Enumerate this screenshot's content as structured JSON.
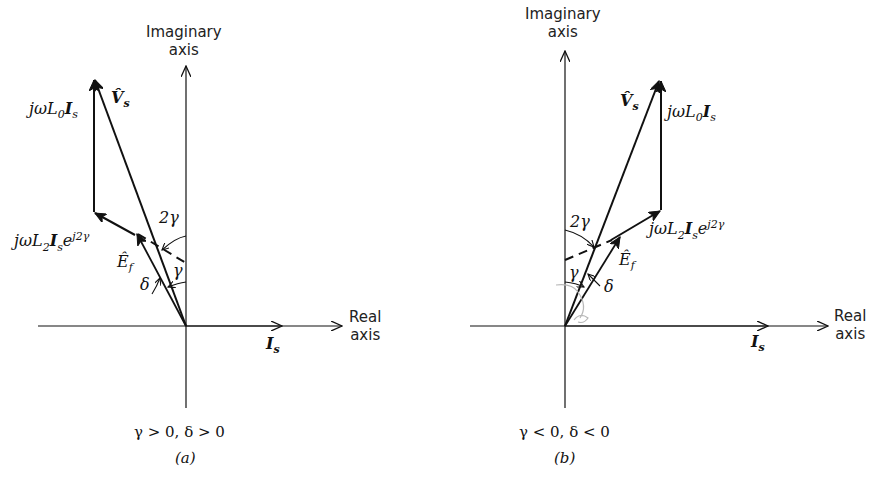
{
  "figure": {
    "panels": [
      {
        "id": "a",
        "imag_axis_label_line1": "Imaginary",
        "imag_axis_label_line2": "axis",
        "real_axis_label_line1": "Real",
        "real_axis_label_line2": "axis",
        "current_label": "I",
        "current_sub": "s",
        "vs_label": "V̂",
        "vs_sub": "s",
        "l0_pre": "jωL",
        "l0_sub1": "0",
        "l0_mid": "I",
        "l0_sub2": "s",
        "l2_pre": "jωL",
        "l2_sub1": "2",
        "l2_mid": "I",
        "l2_sub2": "s",
        "l2_e": "e",
        "l2_sup": "j2γ",
        "ef_label": "Ê",
        "ef_sub": "f",
        "angle_2gamma": "2γ",
        "angle_gamma": "γ",
        "angle_delta": "δ",
        "condition": "γ > 0, δ > 0",
        "caption": "(a)"
      },
      {
        "id": "b",
        "imag_axis_label_line1": "Imaginary",
        "imag_axis_label_line2": "axis",
        "real_axis_label_line1": "Real",
        "real_axis_label_line2": "axis",
        "current_label": "I",
        "current_sub": "s",
        "vs_label": "V̂",
        "vs_sub": "s",
        "l0_pre": "jωL",
        "l0_sub1": "0",
        "l0_mid": "I",
        "l0_sub2": "s",
        "l2_pre": "jωL",
        "l2_sub1": "2",
        "l2_mid": "I",
        "l2_sub2": "s",
        "l2_e": "e",
        "l2_sup": "j2γ",
        "ef_label": "Ê",
        "ef_sub": "f",
        "angle_2gamma": "2γ",
        "angle_gamma": "γ",
        "angle_delta": "δ",
        "condition": "γ < 0, δ < 0",
        "caption": "(b)"
      }
    ]
  }
}
